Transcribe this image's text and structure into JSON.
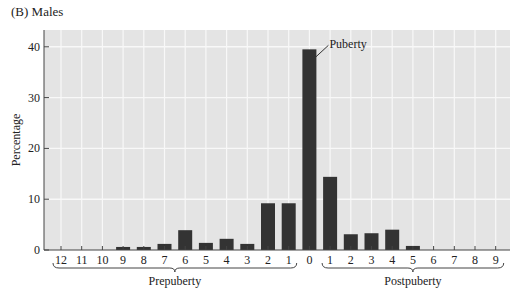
{
  "title": "(B) Males",
  "chart_data": {
    "type": "bar",
    "title": "(B) Males",
    "xlabel": "",
    "ylabel": "Percentage",
    "ylim": [
      0,
      43
    ],
    "yticks": [
      0,
      10,
      20,
      30,
      40
    ],
    "grid": true,
    "legend": null,
    "categories": [
      "12",
      "11",
      "10",
      "9",
      "8",
      "7",
      "6",
      "5",
      "4",
      "3",
      "2",
      "1",
      "0",
      "1",
      "2",
      "3",
      "4",
      "5",
      "6",
      "7",
      "8",
      "9"
    ],
    "values": [
      0,
      0,
      0,
      0.6,
      0.6,
      1.2,
      3.9,
      1.4,
      2.2,
      1.2,
      9.2,
      9.2,
      39.5,
      14.4,
      3.1,
      3.3,
      4.0,
      0.8,
      0,
      0,
      0,
      0
    ],
    "groups": [
      {
        "label": "Prepuberty",
        "from": 0,
        "to": 11
      },
      {
        "label": "Postpuberty",
        "from": 13,
        "to": 21
      }
    ],
    "annotations": [
      {
        "text": "Puberty",
        "category_index": 12
      }
    ],
    "colors": {
      "bar": "#333333",
      "plot_bg": "#e4e4e4",
      "grid": "#f8f8f8"
    }
  }
}
